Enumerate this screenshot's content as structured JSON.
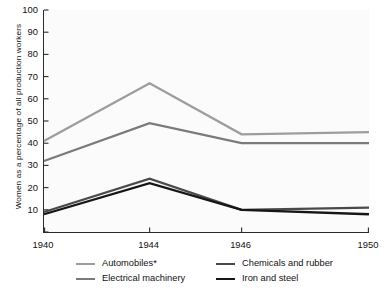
{
  "chart_data": {
    "type": "line",
    "title": "",
    "xlabel": "",
    "ylabel": "Women as a percentage of all production workers",
    "x": [
      1940,
      1944,
      1946,
      1950
    ],
    "xticklabels": [
      "1940",
      "1944",
      "1946",
      "1950"
    ],
    "yticklabels": [
      "0",
      "10",
      "20",
      "30",
      "40",
      "50",
      "60",
      "70",
      "80",
      "90",
      "100"
    ],
    "ylim": [
      0,
      100
    ],
    "ytick_step": 10,
    "grid": false,
    "legend_position": "below",
    "series": [
      {
        "name": "Automobiles*",
        "color": "#9d9d9d",
        "values": [
          41,
          67,
          44,
          45
        ]
      },
      {
        "name": "Electrical machinery",
        "color": "#7a7a7a",
        "values": [
          32,
          49,
          40,
          40
        ]
      },
      {
        "name": "Chemicals and rubber",
        "color": "#4a4a4a",
        "values": [
          9,
          24,
          10,
          11
        ]
      },
      {
        "name": "Iron and steel",
        "color": "#161616",
        "values": [
          8,
          22,
          10,
          8
        ]
      }
    ]
  },
  "legend": {
    "items": [
      {
        "label": "Automobiles*"
      },
      {
        "label": "Chemicals and rubber"
      },
      {
        "label": "Electrical machinery"
      },
      {
        "label": "Iron and steel"
      }
    ]
  },
  "axes": {
    "y_title": "Women as a percentage of all production workers"
  },
  "colors": {
    "axis": "#2b2b2b",
    "plot_background": "#fbfbfb",
    "text": "#111111"
  }
}
